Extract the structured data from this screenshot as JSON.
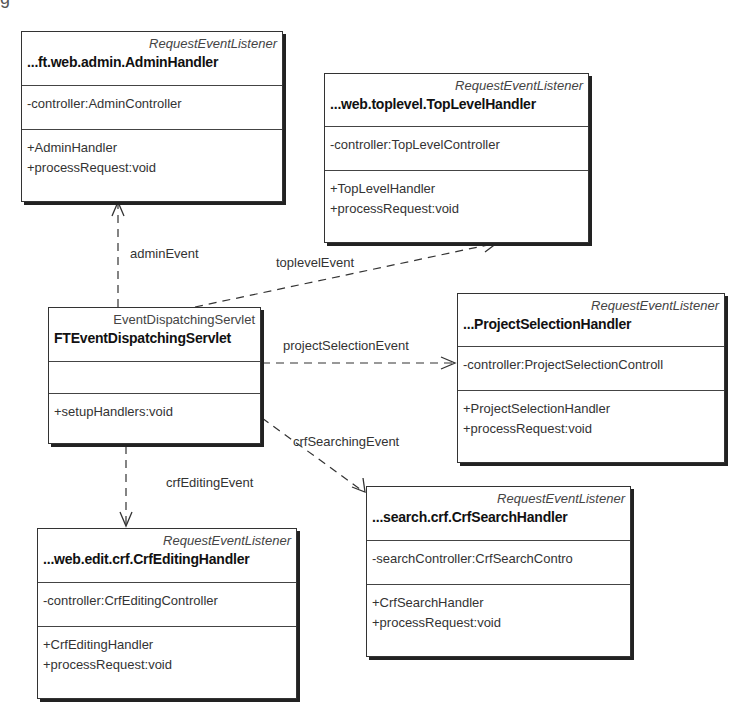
{
  "diagram": {
    "type": "uml-class-diagram",
    "corner_fragment": "g",
    "classes": [
      {
        "id": "admin",
        "stereotype": "RequestEventListener",
        "name": "...ft.web.admin.AdminHandler",
        "attributes": [
          "-controller:AdminController"
        ],
        "operations": [
          "+AdminHandler",
          "+processRequest:void"
        ]
      },
      {
        "id": "toplevel",
        "stereotype": "RequestEventListener",
        "name": "...web.toplevel.TopLevelHandler",
        "attributes": [
          "-controller:TopLevelController"
        ],
        "operations": [
          "+TopLevelHandler",
          "+processRequest:void"
        ]
      },
      {
        "id": "dispatcher",
        "stereotype": "EventDispatchingServlet",
        "name": "FTEventDispatchingServlet",
        "attributes": [],
        "operations": [
          "+setupHandlers:void"
        ]
      },
      {
        "id": "projectselection",
        "stereotype": "RequestEventListener",
        "name": "...ProjectSelectionHandler",
        "attributes": [
          "-controller:ProjectSelectionControll"
        ],
        "operations": [
          "+ProjectSelectionHandler",
          "+processRequest:void"
        ]
      },
      {
        "id": "crfediting",
        "stereotype": "RequestEventListener",
        "name": "...web.edit.crf.CrfEditingHandler",
        "attributes": [
          "-controller:CrfEditingController"
        ],
        "operations": [
          "+CrfEditingHandler",
          "+processRequest:void"
        ]
      },
      {
        "id": "crfsearch",
        "stereotype": "RequestEventListener",
        "name": "...search.crf.CrfSearchHandler",
        "attributes": [
          "-searchController:CrfSearchContro"
        ],
        "operations": [
          "+CrfSearchHandler",
          "+processRequest:void"
        ]
      }
    ],
    "dependencies": [
      {
        "from": "dispatcher",
        "to": "admin",
        "label": "adminEvent"
      },
      {
        "from": "dispatcher",
        "to": "toplevel",
        "label": "toplevelEvent"
      },
      {
        "from": "dispatcher",
        "to": "projectselection",
        "label": "projectSelectionEvent"
      },
      {
        "from": "dispatcher",
        "to": "crfsearch",
        "label": "crfSearchingEvent"
      },
      {
        "from": "dispatcher",
        "to": "crfediting",
        "label": "crfEditingEvent"
      }
    ],
    "colors": {
      "line": "#333333",
      "background": "#ffffff",
      "shadow": "#222222"
    }
  }
}
